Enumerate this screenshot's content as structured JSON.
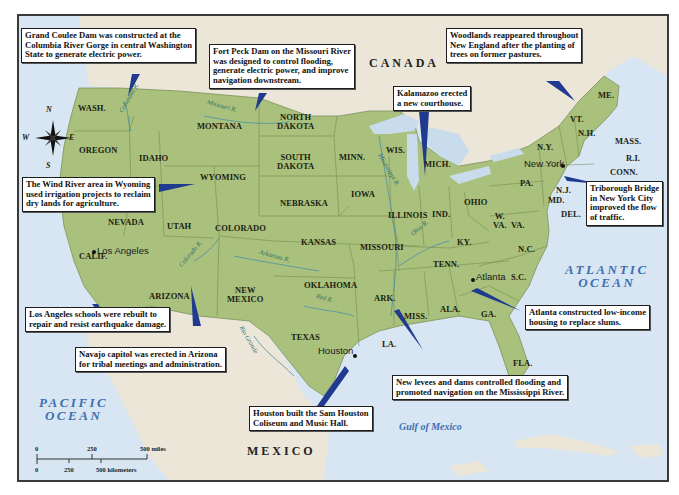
{
  "map": {
    "colors": {
      "land_us": "#a9c17c",
      "land_foreign": "#ece6d8",
      "water": "#d7e6f2",
      "callout_pointer": "#1f3a8f",
      "ocean_text": "#3c6fb0",
      "river_text": "#2e6f6a",
      "frame": "#3a3a3a"
    },
    "countries": {
      "canada": "CANADA",
      "mexico": "MEXICO"
    },
    "water_bodies": {
      "pacific_line1": "PACIFIC",
      "pacific_line2": "OCEAN",
      "atlantic_line1": "ATLANTIC",
      "atlantic_line2": "OCEAN",
      "gulf": "Gulf of Mexico"
    },
    "rivers": {
      "columbia": "Columbia R.",
      "missouri": "Missouri R.",
      "mississippi": "Mississippi R.",
      "colorado": "Colorado R.",
      "arkansas": "Arkansas R.",
      "ohio": "Ohio R.",
      "red": "Red R.",
      "rio_grande": "Rio Grande"
    },
    "states": {
      "wash": "WASH.",
      "oregon": "OREGON",
      "idaho": "IDAHO",
      "montana": "MONTANA",
      "wyoming": "WYOMING",
      "nevada": "NEVADA",
      "utah": "UTAH",
      "colorado": "COLORADO",
      "calif": "CALIF.",
      "arizona": "ARIZONA",
      "new_mexico_1": "NEW",
      "new_mexico_2": "MEXICO",
      "north_dakota_1": "NORTH",
      "north_dakota_2": "DAKOTA",
      "south_dakota_1": "SOUTH",
      "south_dakota_2": "DAKOTA",
      "nebraska": "NEBRASKA",
      "kansas": "KANSAS",
      "oklahoma": "OKLAHOMA",
      "texas": "TEXAS",
      "minn": "MINN.",
      "iowa": "IOWA",
      "missouri": "MISSOURI",
      "ark": "ARK.",
      "la": "LA.",
      "wis": "WIS.",
      "illinois": "ILLINOIS",
      "mich": "MICH.",
      "ind": "IND.",
      "ohio": "OHIO",
      "ky": "KY.",
      "tenn": "TENN.",
      "miss": "MISS.",
      "ala": "ALA.",
      "ga": "GA.",
      "fla": "FLA.",
      "sc": "S.C.",
      "nc": "N.C.",
      "va": "VA.",
      "wva_1": "W.",
      "wva_2": "VA.",
      "pa": "PA.",
      "ny": "N.Y.",
      "nj": "N.J.",
      "md": "MD.",
      "del": "DEL.",
      "vt": "VT.",
      "nh": "N.H.",
      "me": "ME.",
      "mass": "MASS.",
      "ri": "R.I.",
      "conn": "CONN."
    },
    "cities": {
      "los_angeles": "Los Angeles",
      "houston": "Houston",
      "atlanta": "Atlanta",
      "new_york": "New York"
    },
    "compass": {
      "n": "N",
      "s": "S",
      "e": "E",
      "w": "W"
    },
    "scale": {
      "miles_0": "0",
      "miles_250": "250",
      "miles_500": "500 miles",
      "km_0": "0",
      "km_250": "250",
      "km_500": "500 kilometers"
    },
    "callouts": [
      {
        "id": "grand-coulee",
        "lines": [
          "Grand Coulee Dam was constructed at the",
          "Columbia River Gorge in central Washington",
          "State to generate electric power."
        ]
      },
      {
        "id": "fort-peck",
        "lines": [
          "Fort Peck Dam on the Missouri River",
          "was designed to control flooding,",
          "generate electric power, and improve",
          "navigation downstream."
        ]
      },
      {
        "id": "new-england",
        "lines": [
          "Woodlands reappeared throughout",
          "New England after the planting of",
          "trees on former pastures."
        ]
      },
      {
        "id": "kalamazoo",
        "lines": [
          "Kalamazoo erected",
          "a new courthouse."
        ]
      },
      {
        "id": "wind-river",
        "lines": [
          "The Wind River area in Wyoming",
          "used irrigation projects to reclaim",
          "dry lands for agriculture."
        ]
      },
      {
        "id": "triborough",
        "lines": [
          "Triborough Bridge",
          "in New York City",
          "improved the flow",
          "of traffic."
        ]
      },
      {
        "id": "los-angeles",
        "lines": [
          "Los Angeles schools were rebuilt to",
          "repair and resist earthquake damage."
        ]
      },
      {
        "id": "navajo",
        "lines": [
          "Navajo capitol was erected in Arizona",
          "for tribal meetings and administration."
        ]
      },
      {
        "id": "atlanta",
        "lines": [
          "Atlanta constructed low-income",
          "housing to replace slums."
        ]
      },
      {
        "id": "mississippi",
        "lines": [
          "New levees and dams controlled flooding and",
          "promoted navigation on the Mississippi River."
        ]
      },
      {
        "id": "houston",
        "lines": [
          "Houston built the Sam Houston",
          "Coliseum and Music Hall."
        ]
      }
    ]
  }
}
